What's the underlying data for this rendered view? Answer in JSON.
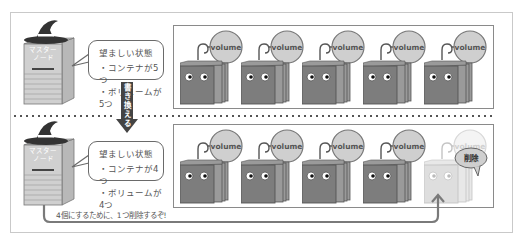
{
  "diagram": {
    "top": {
      "master_node_label": [
        "マスター",
        "ノード"
      ],
      "desired_state": {
        "title": "望ましい状態",
        "items": [
          "・コンテナが5つ",
          "・ボリュームが5つ"
        ]
      },
      "containers": [
        {
          "volume_label": "volume",
          "state": "active"
        },
        {
          "volume_label": "volume",
          "state": "active"
        },
        {
          "volume_label": "volume",
          "state": "active"
        },
        {
          "volume_label": "volume",
          "state": "active"
        },
        {
          "volume_label": "volume",
          "state": "active"
        }
      ]
    },
    "rewrite_arrow_label": "書き換える",
    "bottom": {
      "master_node_label": [
        "マスター",
        "ノード"
      ],
      "desired_state": {
        "title": "望ましい状態",
        "items": [
          "・コンテナが4つ",
          "・ボリュームが4つ"
        ]
      },
      "containers": [
        {
          "volume_label": "volume",
          "state": "active"
        },
        {
          "volume_label": "volume",
          "state": "active"
        },
        {
          "volume_label": "volume",
          "state": "active"
        },
        {
          "volume_label": "volume",
          "state": "active"
        },
        {
          "volume_label": "volume",
          "state": "deleted",
          "delete_label": "削除"
        }
      ],
      "caption": "4個にするために、1つ削除するぞ!"
    },
    "colors": {
      "container_dark": "#7d7d7d",
      "container_deleted": "#dcdcdc",
      "volume_fill": "#cfcfcf",
      "border": "#8a8a8a",
      "hat": "#333333"
    }
  }
}
